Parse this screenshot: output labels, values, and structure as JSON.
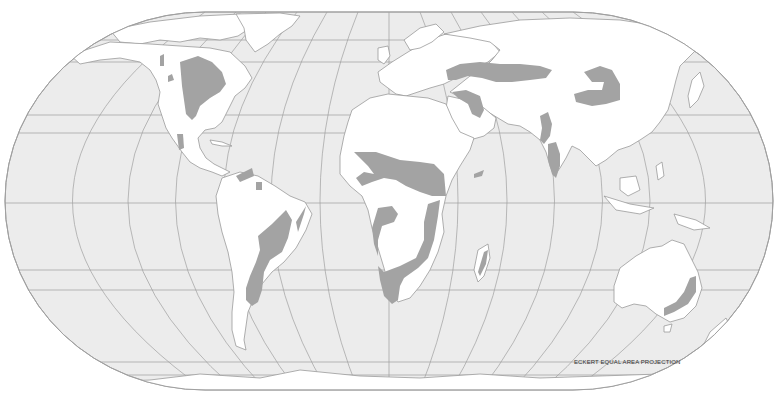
{
  "map": {
    "projection_label": "ECKERT EQUAL AREA PROJECTION",
    "colors": {
      "background": "#ffffff",
      "ocean": "#ececec",
      "land": "#ffffff",
      "coastline": "#9a9a9a",
      "graticule": "#9a9a9a",
      "highlight_region": "#a3a3a3"
    },
    "highlighted_regions": [
      "North America (Great Plains)",
      "Mexico",
      "Northern South America",
      "South America (Brazil / Pampas)",
      "Sahel / West Africa",
      "East Africa",
      "Southern Africa",
      "Madagascar",
      "Eastern Europe / Central Asian Steppe",
      "Middle East / Turkey",
      "Mongolia / Northern China",
      "India",
      "Eastern Australia"
    ]
  }
}
